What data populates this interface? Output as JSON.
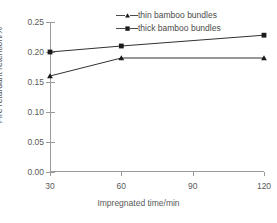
{
  "chart_data": {
    "type": "line",
    "title": "",
    "xlabel": "Impregnated time/min",
    "ylabel": "Fire retardant retention/%",
    "categories": [
      30,
      60,
      90,
      120
    ],
    "x_tick_labels": [
      "30",
      "60",
      "90",
      "120"
    ],
    "y_tick_labels": [
      "0.00",
      "0.05",
      "0.10",
      "0.15",
      "0.20",
      "0.25"
    ],
    "y_tick_values": [
      0.0,
      0.05,
      0.1,
      0.15,
      0.2,
      0.25
    ],
    "ylim": [
      0.0,
      0.25
    ],
    "grid": false,
    "legend_position": "top-center-inside",
    "series": [
      {
        "name": "thin bamboo bundles",
        "marker": "triangle",
        "color": "#1a1a1a",
        "x": [
          30,
          60,
          120
        ],
        "values": [
          0.16,
          0.19,
          0.19
        ]
      },
      {
        "name": "thick bamboo bundles",
        "marker": "square",
        "color": "#1a1a1a",
        "x": [
          30,
          60,
          120
        ],
        "values": [
          0.2,
          0.21,
          0.228
        ]
      }
    ]
  },
  "legend": {
    "items": [
      {
        "label": "thin bamboo bundles"
      },
      {
        "label": "thick bamboo bundles"
      }
    ]
  },
  "axes": {
    "x_title": "Impregnated time/min",
    "y_title": "Fire retardant retention/%"
  }
}
